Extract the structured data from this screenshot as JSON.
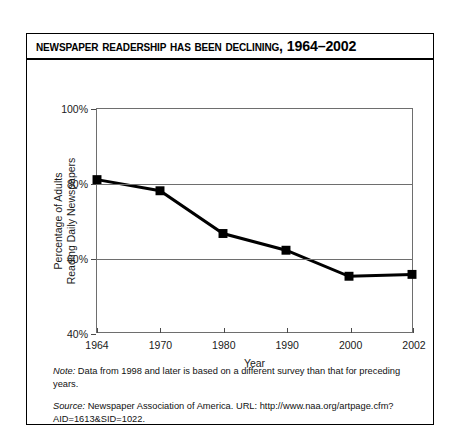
{
  "figure": {
    "title": "Newspaper Readership Has Been Declining, 1964–2002",
    "note_label": "Note:",
    "note_text": " Data from 1998 and later is based on a different survey than that for preceding years.",
    "source_label": "Source:",
    "source_text": " Newspaper Association of America. URL: http://www.naa.org/artpage.cfm?AID=1613&SID=1022."
  },
  "chart_data": {
    "type": "line",
    "title": "Newspaper Readership Has Been Declining, 1964–2002",
    "xlabel": "Year",
    "ylabel": "Percentage of Adults Reading Daily Newspapers",
    "ylabel_lines": [
      "Percentage of Adults",
      "Reading Daily Newspapers"
    ],
    "categories": [
      "1964",
      "1970",
      "1980",
      "1990",
      "2000",
      "2002"
    ],
    "values": [
      81,
      78,
      66.5,
      62,
      55,
      55.5
    ],
    "ylim": [
      40,
      100
    ],
    "yticks": [
      40,
      60,
      80,
      100
    ],
    "ytick_labels": [
      "40%",
      "60%",
      "80%",
      "100%"
    ],
    "gridlines": [
      60,
      80,
      100
    ],
    "grid": true,
    "legend": "none",
    "series_color": "#000000",
    "grid_color": "#6e6e6e",
    "marker": "square"
  }
}
